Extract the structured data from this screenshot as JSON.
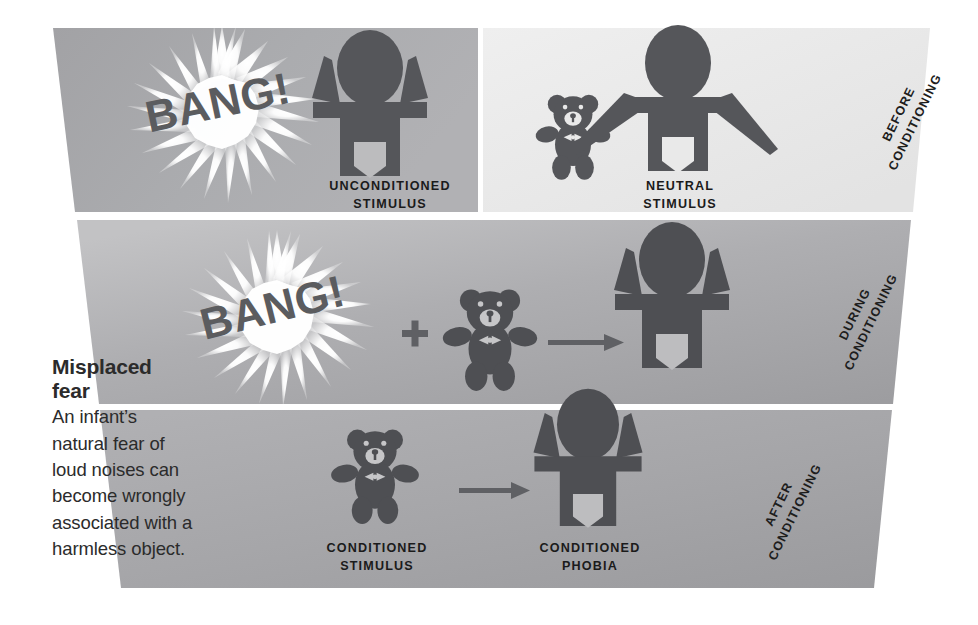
{
  "caption": {
    "heading_line1": "Misplaced",
    "heading_line2": "fear",
    "body_line1": "An infant’s",
    "body_line2": "natural fear of",
    "body_line3": "loud noises can",
    "body_line4": "become wrongly",
    "body_line5": "associated with a",
    "body_line6": "harmless object."
  },
  "stages": [
    {
      "id": "before",
      "line1": "BEFORE",
      "line2": "CONDITIONING"
    },
    {
      "id": "during",
      "line1": "DURING",
      "line2": "CONDITIONING"
    },
    {
      "id": "after",
      "line1": "AFTER",
      "line2": "CONDITIONING"
    }
  ],
  "panels": {
    "row1": {
      "cell_left": {
        "label_line1": "UNCONDITIONED",
        "label_line2": "STIMULUS",
        "burst_text": "BANG!"
      },
      "cell_right": {
        "label_line1": "NEUTRAL",
        "label_line2": "STIMULUS"
      }
    },
    "row2": {
      "burst_text": "BANG!",
      "operator_plus": "+",
      "operator_arrow": "→"
    },
    "row3": {
      "cell_left": {
        "label_line1": "CONDITIONED",
        "label_line2": "STIMULUS"
      },
      "cell_right": {
        "label_line1": "CONDITIONED",
        "label_line2": "PHOBIA"
      },
      "operator_arrow": "→"
    }
  },
  "colors": {
    "figure": "#55565a",
    "figure_dark": "#4c4d51",
    "panel_row1_left": "#a9a9ac",
    "panel_row1_right": "#ececec",
    "panel_row2": "#a8a8ab",
    "panel_row3": "#a5a5a8",
    "burst_white": "#ffffff",
    "bang_text": "#5a5b5e",
    "text": "#2b2b2b",
    "background": "#ffffff"
  }
}
